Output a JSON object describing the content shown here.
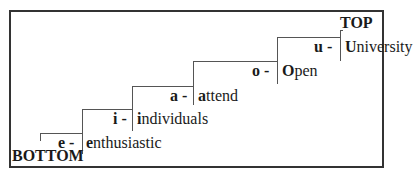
{
  "diagram": {
    "top_label": "TOP",
    "bottom_label": "BOTTOM",
    "steps": [
      {
        "letter": "e -",
        "initial": "e",
        "rest": "nthusiastic",
        "word": "enthusiastic"
      },
      {
        "letter": "i -",
        "initial": "i",
        "rest": "ndividuals",
        "word": "individuals"
      },
      {
        "letter": "a -",
        "initial": "a",
        "rest": "ttend",
        "word": "attend"
      },
      {
        "letter": "o -",
        "initial": "O",
        "rest": "pen",
        "word": "Open"
      },
      {
        "letter": "u -",
        "initial": "U",
        "rest": "niversity",
        "word": "University"
      }
    ]
  }
}
